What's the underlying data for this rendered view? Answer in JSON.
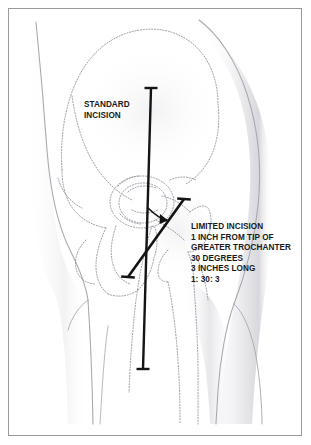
{
  "figure": {
    "background_color": "#ffffff",
    "border_color": "#9a9a9a",
    "ink_color": "#1a1a1a",
    "bone_outline_color": "#9a9aa4",
    "soft_tissue_color": "#b9b9bf"
  },
  "labels": {
    "standard": {
      "name": "standard-incision-label",
      "lines": [
        "STANDARD",
        "INCISION"
      ]
    },
    "limited": {
      "name": "limited-incision-label",
      "lines": [
        "LIMITED INCISION",
        "1 INCH FROM TIP OF",
        "GREATER TROCHANTER",
        "30 DEGREES",
        "3 INCHES LONG",
        "1: 30: 3"
      ]
    }
  },
  "markings": {
    "standard_incision": {
      "name": "standard-incision-line",
      "description": "long vertical black line with perpendicular end caps",
      "x1": 151,
      "y1": 88,
      "x2": 143,
      "y2": 369,
      "cap_length": 13,
      "stroke_width": 2.4
    },
    "limited_incision": {
      "name": "limited-incision-line",
      "description": "short oblique black line with perpendicular end caps",
      "x1": 184,
      "y1": 199,
      "x2": 128,
      "y2": 277,
      "cap_length": 13,
      "stroke_width": 2.6
    },
    "angle_arc": {
      "name": "angle-arc-indicator",
      "description": "curved arrow marking the 30 degree angle between the two incisions",
      "degrees": "30"
    }
  },
  "anatomy": [
    {
      "name": "iliac-crest-outline",
      "style": "dotted"
    },
    {
      "name": "ilium-outline",
      "style": "dotted"
    },
    {
      "name": "acetabulum-outline",
      "style": "dotted"
    },
    {
      "name": "femoral-head-outline",
      "style": "dotted"
    },
    {
      "name": "femoral-neck-outline",
      "style": "dotted"
    },
    {
      "name": "greater-trochanter-outline",
      "style": "dotted"
    },
    {
      "name": "lesser-trochanter-outline",
      "style": "dotted"
    },
    {
      "name": "femoral-shaft-outline",
      "style": "dotted"
    },
    {
      "name": "pubic-ramus-outline",
      "style": "dotted"
    },
    {
      "name": "ischium-outline",
      "style": "dotted"
    },
    {
      "name": "obturator-foramen-outline",
      "style": "dotted"
    },
    {
      "name": "body-silhouette-medial",
      "style": "solid-light"
    },
    {
      "name": "body-silhouette-lateral",
      "style": "solid-light"
    },
    {
      "name": "buttock-contour",
      "style": "solid-light"
    },
    {
      "name": "thigh-contour",
      "style": "solid-light"
    }
  ]
}
